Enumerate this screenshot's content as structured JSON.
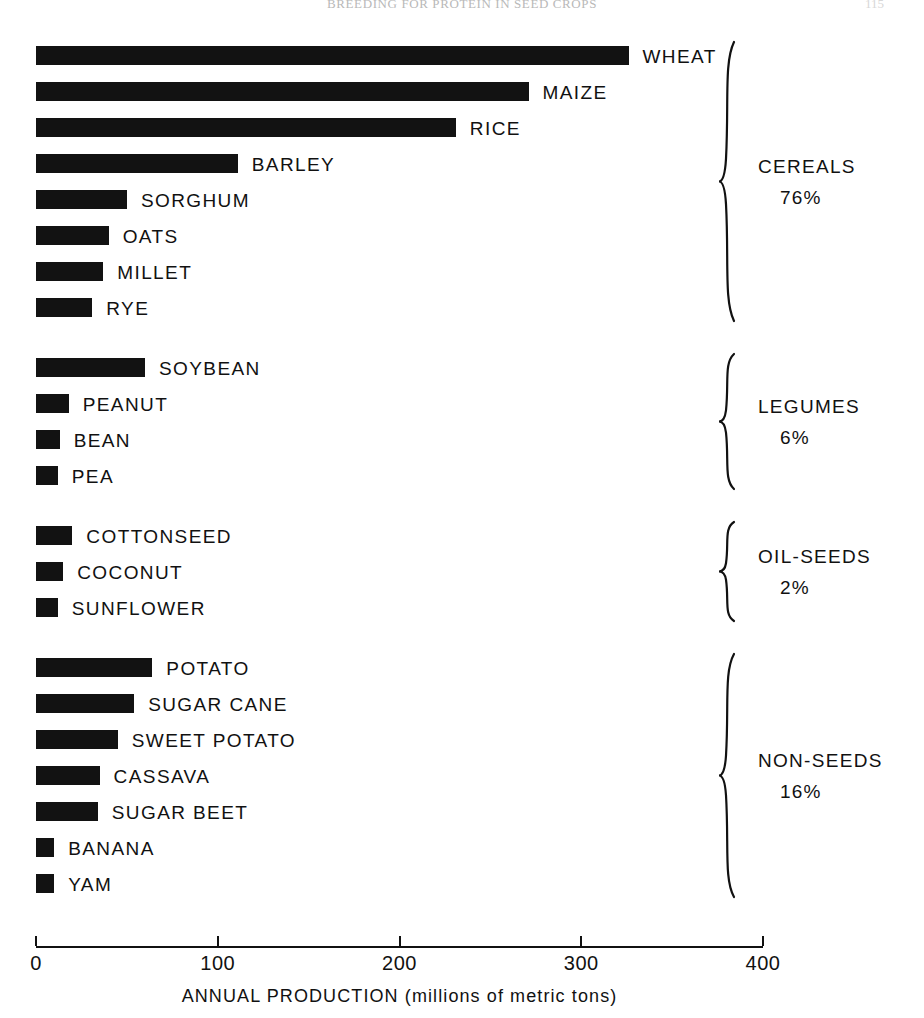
{
  "running_head": {
    "title": "BREEDING FOR PROTEIN IN SEED CROPS",
    "page_number": "115"
  },
  "chart_data": {
    "type": "bar",
    "orientation": "horizontal",
    "title": "",
    "xlabel": "ANNUAL PRODUCTION (millions of metric tons)",
    "ylabel": "",
    "xlim": [
      0,
      400
    ],
    "xticks": [
      0,
      100,
      200,
      300,
      400
    ],
    "xtick_labels": [
      "0",
      "100",
      "200",
      "300",
      "400"
    ],
    "grid": false,
    "legend": "none",
    "bar_color": "#121212",
    "units": "millions of metric tons",
    "categories": [
      "WHEAT",
      "MAIZE",
      "RICE",
      "BARLEY",
      "SORGHUM",
      "OATS",
      "MILLET",
      "RYE",
      "SOYBEAN",
      "PEANUT",
      "BEAN",
      "PEA",
      "COTTONSEED",
      "COCONUT",
      "SUNFLOWER",
      "POTATO",
      "SUGAR CANE",
      "SWEET POTATO",
      "CASSAVA",
      "SUGAR BEET",
      "BANANA",
      "YAM"
    ],
    "values": [
      326,
      271,
      231,
      111,
      50,
      40,
      37,
      31,
      60,
      18,
      13,
      12,
      20,
      15,
      12,
      64,
      54,
      45,
      35,
      34,
      10,
      10
    ],
    "groups": [
      {
        "name": "CEREALS",
        "percent": "76%",
        "items": [
          {
            "label": "WHEAT",
            "value": 326
          },
          {
            "label": "MAIZE",
            "value": 271
          },
          {
            "label": "RICE",
            "value": 231
          },
          {
            "label": "BARLEY",
            "value": 111
          },
          {
            "label": "SORGHUM",
            "value": 50
          },
          {
            "label": "OATS",
            "value": 40
          },
          {
            "label": "MILLET",
            "value": 37
          },
          {
            "label": "RYE",
            "value": 31
          }
        ]
      },
      {
        "name": "LEGUMES",
        "percent": "6%",
        "items": [
          {
            "label": "SOYBEAN",
            "value": 60
          },
          {
            "label": "PEANUT",
            "value": 18
          },
          {
            "label": "BEAN",
            "value": 13
          },
          {
            "label": "PEA",
            "value": 12
          }
        ]
      },
      {
        "name": "OIL-SEEDS",
        "percent": "2%",
        "items": [
          {
            "label": "COTTONSEED",
            "value": 20
          },
          {
            "label": "COCONUT",
            "value": 15
          },
          {
            "label": "SUNFLOWER",
            "value": 12
          }
        ]
      },
      {
        "name": "NON-SEEDS",
        "percent": "16%",
        "items": [
          {
            "label": "POTATO",
            "value": 64
          },
          {
            "label": "SUGAR CANE",
            "value": 54
          },
          {
            "label": "SWEET POTATO",
            "value": 45
          },
          {
            "label": "CASSAVA",
            "value": 35
          },
          {
            "label": "SUGAR BEET",
            "value": 34
          },
          {
            "label": "BANANA",
            "value": 10
          },
          {
            "label": "YAM",
            "value": 10
          }
        ]
      }
    ]
  }
}
